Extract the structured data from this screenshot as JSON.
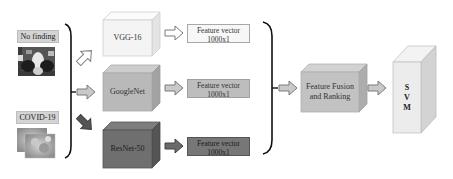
{
  "inputs": [
    {
      "label": "No finding",
      "image": "chest-xray-normal"
    },
    {
      "label": "COVID-19",
      "image": "chest-ct-covid"
    }
  ],
  "models": [
    {
      "name": "VGG-16",
      "color": "#f4f4f4",
      "feature": {
        "line1": "Feature vector",
        "line2": "1000x1",
        "color": "#f7f7f7"
      }
    },
    {
      "name": "GoogleNet",
      "color": "#b9b9b9",
      "feature": {
        "line1": "Feature vector",
        "line2": "1000x1",
        "color": "#bdbdbd"
      }
    },
    {
      "name": "ResNet-50",
      "color": "#6f6f6f",
      "feature": {
        "line1": "Feature vector",
        "line2": "1000x1",
        "color": "#777777"
      }
    }
  ],
  "fusion": {
    "line1": "Feature Fusion",
    "line2": "and Ranking",
    "color": "#c2c2c2"
  },
  "classifier": {
    "letters": [
      "S",
      "V",
      "M"
    ],
    "color": "#ececec"
  },
  "arrows": {
    "input_arrows": [
      "outline-up-right",
      "gray-right",
      "dark-down-right"
    ],
    "edge_color": "#8a8a8a"
  }
}
